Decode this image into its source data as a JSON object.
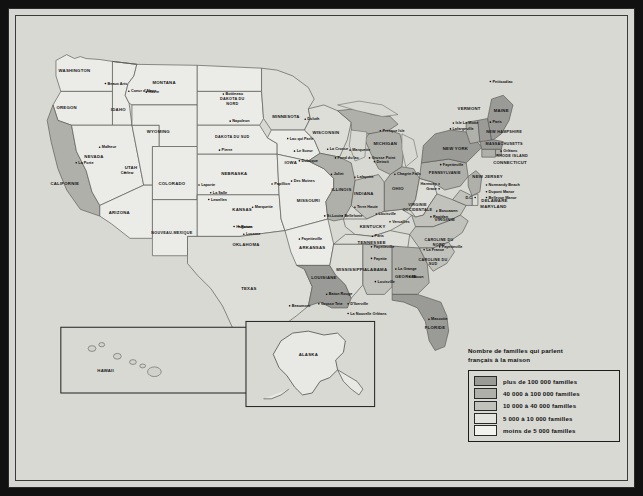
{
  "map": {
    "title": "Carte des familles francophones aux Etats-Unis",
    "legend": {
      "title": "Nombre de familles qui parlent\nfrançais à la maison",
      "entries": [
        {
          "label": "plus de 100 000 familles",
          "swatch": "c5",
          "color": "#9a9a96"
        },
        {
          "label": "40 000 à 100 000 familles",
          "swatch": "c4",
          "color": "#b0b0ab"
        },
        {
          "label": "10 000 à 40 000 familles",
          "swatch": "c3",
          "color": "#c2c2bd"
        },
        {
          "label": "5 000 à 10 000 familles",
          "swatch": "c2",
          "color": "#e4e4df"
        },
        {
          "label": "moins de 5 000 familles",
          "swatch": "c1",
          "color": "#f2f2ee"
        }
      ]
    },
    "insets": [
      {
        "name": "hawaii",
        "label": "HAWAII"
      },
      {
        "name": "alaska",
        "label": "ALASKA"
      }
    ],
    "states": [
      {
        "id": "wa",
        "label": "WASHINGTON",
        "x": 60,
        "y": 58,
        "cls": "c1"
      },
      {
        "id": "or",
        "label": "OREGON",
        "x": 52,
        "y": 96,
        "cls": "c1"
      },
      {
        "id": "ca",
        "label": "CALIFORNIE",
        "x": 50,
        "y": 175,
        "cls": "c4"
      },
      {
        "id": "id",
        "label": "IDAHO",
        "x": 105,
        "y": 98,
        "cls": "c1"
      },
      {
        "id": "nv",
        "label": "NEVADA",
        "x": 80,
        "y": 147,
        "cls": "c1"
      },
      {
        "id": "ut",
        "label": "UTAH",
        "x": 118,
        "y": 158,
        "cls": "c1"
      },
      {
        "id": "az",
        "label": "ARIZONA",
        "x": 106,
        "y": 205,
        "cls": "c1"
      },
      {
        "id": "mt",
        "label": "MONTANA",
        "x": 152,
        "y": 70,
        "cls": "c1"
      },
      {
        "id": "wy",
        "label": "WYOMING",
        "x": 146,
        "y": 121,
        "cls": "c1"
      },
      {
        "id": "co",
        "label": "COLORADO",
        "x": 160,
        "y": 175,
        "cls": "c1"
      },
      {
        "id": "nm",
        "label": "NOUVEAU-MEXIQUE",
        "x": 160,
        "y": 226,
        "cls": "c1"
      },
      {
        "id": "nd",
        "label": "DAKOTA DU NORD",
        "x": 222,
        "y": 87,
        "cls": "c1"
      },
      {
        "id": "sd",
        "label": "DAKOTA DU SUD",
        "x": 222,
        "y": 126,
        "cls": "c1"
      },
      {
        "id": "ne",
        "label": "NEBRASKA",
        "x": 224,
        "y": 165,
        "cls": "c1"
      },
      {
        "id": "ks",
        "label": "KANSAS",
        "x": 232,
        "y": 202,
        "cls": "c1"
      },
      {
        "id": "ok",
        "label": "OKLAHOMA",
        "x": 236,
        "y": 238,
        "cls": "c1"
      },
      {
        "id": "tx",
        "label": "TEXAS",
        "x": 239,
        "y": 283,
        "cls": "c2"
      },
      {
        "id": "mn",
        "label": "MINNESOTA",
        "x": 277,
        "y": 106,
        "cls": "c2"
      },
      {
        "id": "ia",
        "label": "IOWA",
        "x": 282,
        "y": 153,
        "cls": "c1"
      },
      {
        "id": "mo",
        "label": "MISSOURI",
        "x": 300,
        "y": 192,
        "cls": "c1"
      },
      {
        "id": "ar",
        "label": "ARKANSAS",
        "x": 304,
        "y": 241,
        "cls": "c1"
      },
      {
        "id": "la",
        "label": "LOUISIANE",
        "x": 316,
        "y": 272,
        "cls": "c5"
      },
      {
        "id": "wi",
        "label": "WISCONSIN",
        "x": 318,
        "y": 122,
        "cls": "c2"
      },
      {
        "id": "il",
        "label": "ILLINOIS",
        "x": 334,
        "y": 181,
        "cls": "c4"
      },
      {
        "id": "ms",
        "label": "MISSISSIPPI",
        "x": 343,
        "y": 264,
        "cls": "c2"
      },
      {
        "id": "mi",
        "label": "MICHIGAN",
        "x": 379,
        "y": 133,
        "cls": "c4"
      },
      {
        "id": "in",
        "label": "INDIANA",
        "x": 357,
        "y": 185,
        "cls": "c3"
      },
      {
        "id": "ky",
        "label": "KENTUCKY",
        "x": 366,
        "y": 219,
        "cls": "c2"
      },
      {
        "id": "tn",
        "label": "TENNESSEE",
        "x": 365,
        "y": 236,
        "cls": "c2"
      },
      {
        "id": "al",
        "label": "ALABAMA",
        "x": 369,
        "y": 264,
        "cls": "c3"
      },
      {
        "id": "oh",
        "label": "OHIO",
        "x": 392,
        "y": 180,
        "cls": "c4"
      },
      {
        "id": "ga",
        "label": "GEORGIE",
        "x": 400,
        "y": 271,
        "cls": "c4"
      },
      {
        "id": "fl",
        "label": "FLORIDE",
        "x": 430,
        "y": 324,
        "cls": "c5"
      },
      {
        "id": "wv",
        "label": "VIRGINIE OCCIDENTALE",
        "x": 412,
        "y": 197,
        "cls": "c2"
      },
      {
        "id": "va",
        "label": "VIRGINIE",
        "x": 440,
        "y": 212,
        "cls": "c3"
      },
      {
        "id": "nc",
        "label": "CAROLINE DU NORD",
        "x": 434,
        "y": 233,
        "cls": "c3"
      },
      {
        "id": "sc",
        "label": "CAROLINE DU SUD",
        "x": 428,
        "y": 253,
        "cls": "c3"
      },
      {
        "id": "pa",
        "label": "PENNSYLVANIE",
        "x": 440,
        "y": 163,
        "cls": "c4"
      },
      {
        "id": "ny",
        "label": "NEW YORK",
        "x": 451,
        "y": 139,
        "cls": "c5"
      },
      {
        "id": "vt",
        "label": "VERMONT",
        "x": 465,
        "y": 97,
        "cls": "c4"
      },
      {
        "id": "me",
        "label": "MAINE",
        "x": 498,
        "y": 99,
        "cls": "c5"
      },
      {
        "id": "nh",
        "label": "NEW HAMPSHIRE",
        "x": 501,
        "y": 121,
        "cls": "c5"
      },
      {
        "id": "ma",
        "label": "MASSACHUSETTS",
        "x": 501,
        "y": 133,
        "cls": "c5"
      },
      {
        "id": "ri",
        "label": "RHODE ISLAND",
        "x": 509,
        "y": 146,
        "cls": "c4"
      },
      {
        "id": "ct",
        "label": "CONNECTICUT",
        "x": 507,
        "y": 153,
        "cls": "c4"
      },
      {
        "id": "nj",
        "label": "NEW JERSEY",
        "x": 484,
        "y": 168,
        "cls": "c4"
      },
      {
        "id": "de",
        "label": "DELAWARE",
        "x": 491,
        "y": 192,
        "cls": "c2"
      },
      {
        "id": "md",
        "label": "MARYLAND",
        "x": 490,
        "y": 199,
        "cls": "c3"
      }
    ],
    "cities": [
      {
        "label": "Beaux Arts",
        "x": 94,
        "y": 71,
        "anchor": "start"
      },
      {
        "label": "Coeur d'Alene",
        "x": 118,
        "y": 79,
        "anchor": "start"
      },
      {
        "label": "Malheur",
        "x": 88,
        "y": 137,
        "anchor": "start"
      },
      {
        "label": "La Porte",
        "x": 64,
        "y": 153,
        "anchor": "start"
      },
      {
        "label": "Curlew",
        "x": 114,
        "y": 163,
        "anchor": "middle"
      },
      {
        "label": "Havre",
        "x": 136,
        "y": 80,
        "anchor": "start"
      },
      {
        "label": "Bottineau",
        "x": 215,
        "y": 82,
        "anchor": "start"
      },
      {
        "label": "Napoleon",
        "x": 222,
        "y": 110,
        "anchor": "start"
      },
      {
        "label": "Pierre",
        "x": 211,
        "y": 140,
        "anchor": "start"
      },
      {
        "label": "Laporte",
        "x": 190,
        "y": 176,
        "anchor": "start"
      },
      {
        "label": "La Salle",
        "x": 202,
        "y": 184,
        "anchor": "start"
      },
      {
        "label": "Lewellen",
        "x": 200,
        "y": 191,
        "anchor": "start"
      },
      {
        "label": "Papillion",
        "x": 265,
        "y": 175,
        "anchor": "start"
      },
      {
        "label": "Marquette",
        "x": 245,
        "y": 199,
        "anchor": "start"
      },
      {
        "label": "Hugoton",
        "x": 226,
        "y": 219,
        "anchor": "start"
      },
      {
        "label": "Luceme",
        "x": 236,
        "y": 227,
        "anchor": "start"
      },
      {
        "label": "Rosen",
        "x": 231,
        "y": 219,
        "anchor": "start"
      },
      {
        "label": "Duluth",
        "x": 299,
        "y": 108,
        "anchor": "start"
      },
      {
        "label": "Lac qui Parle",
        "x": 281,
        "y": 128,
        "anchor": "start"
      },
      {
        "label": "Le Sueur",
        "x": 288,
        "y": 141,
        "anchor": "start"
      },
      {
        "label": "Dubuque",
        "x": 293,
        "y": 151,
        "anchor": "start"
      },
      {
        "label": "Des Moines",
        "x": 285,
        "y": 172,
        "anchor": "start"
      },
      {
        "label": "La Crosse",
        "x": 322,
        "y": 139,
        "anchor": "start"
      },
      {
        "label": "Marquette",
        "x": 345,
        "y": 140,
        "anchor": "start"
      },
      {
        "label": "Fond du lac",
        "x": 330,
        "y": 148,
        "anchor": "start"
      },
      {
        "label": "Presque Isle",
        "x": 376,
        "y": 120,
        "anchor": "start"
      },
      {
        "label": "Grosse Point",
        "x": 365,
        "y": 148,
        "anchor": "start"
      },
      {
        "label": "Detroit",
        "x": 370,
        "y": 152,
        "anchor": "start"
      },
      {
        "label": "Joliet",
        "x": 326,
        "y": 165,
        "anchor": "start"
      },
      {
        "label": "Lafayette",
        "x": 350,
        "y": 168,
        "anchor": "start"
      },
      {
        "label": "Chagrin Falls",
        "x": 391,
        "y": 165,
        "anchor": "start"
      },
      {
        "label": "Terre Haute",
        "x": 350,
        "y": 199,
        "anchor": "start"
      },
      {
        "label": "St-Louis",
        "x": 319,
        "y": 208,
        "anchor": "start"
      },
      {
        "label": "Bellefonte",
        "x": 337,
        "y": 208,
        "anchor": "start"
      },
      {
        "label": "Louisville",
        "x": 372,
        "y": 206,
        "anchor": "start"
      },
      {
        "label": "Versailles",
        "x": 386,
        "y": 214,
        "anchor": "start"
      },
      {
        "label": "Paris",
        "x": 368,
        "y": 229,
        "anchor": "start"
      },
      {
        "label": "Fayetteville",
        "x": 293,
        "y": 232,
        "anchor": "start"
      },
      {
        "label": "Fayetteville",
        "x": 367,
        "y": 240,
        "anchor": "start"
      },
      {
        "label": "Fayette",
        "x": 367,
        "y": 252,
        "anchor": "start"
      },
      {
        "label": "La Grange",
        "x": 392,
        "y": 263,
        "anchor": "start"
      },
      {
        "label": "Macon",
        "x": 406,
        "y": 271,
        "anchor": "start"
      },
      {
        "label": "Louisville",
        "x": 371,
        "y": 276,
        "anchor": "start"
      },
      {
        "label": "Baton Rouge",
        "x": 321,
        "y": 289,
        "anchor": "start"
      },
      {
        "label": "Grosse Tete",
        "x": 313,
        "y": 299,
        "anchor": "start"
      },
      {
        "label": "Beaumont",
        "x": 283,
        "y": 301,
        "anchor": "start"
      },
      {
        "label": "D'Iberville",
        "x": 343,
        "y": 299,
        "anchor": "start"
      },
      {
        "label": "La Nouvelle Orléans",
        "x": 343,
        "y": 309,
        "anchor": "start"
      },
      {
        "label": "La Salle",
        "x": 250,
        "y": 320,
        "anchor": "start"
      },
      {
        "label": "Mascotte",
        "x": 426,
        "y": 315,
        "anchor": "start"
      },
      {
        "label": "La France",
        "x": 421,
        "y": 243,
        "anchor": "start"
      },
      {
        "label": "Fayetteville",
        "x": 437,
        "y": 240,
        "anchor": "start"
      },
      {
        "label": "Boscawen",
        "x": 434,
        "y": 203,
        "anchor": "start"
      },
      {
        "label": "Rapidan",
        "x": 428,
        "y": 209,
        "anchor": "start"
      },
      {
        "label": "Harmony",
        "x": 432,
        "y": 175,
        "anchor": "end"
      },
      {
        "label": "Grace",
        "x": 432,
        "y": 180,
        "anchor": "end"
      },
      {
        "label": "Normandy Beach",
        "x": 485,
        "y": 176,
        "anchor": "start"
      },
      {
        "label": "Dupont Manor",
        "x": 485,
        "y": 183,
        "anchor": "start"
      },
      {
        "label": "Bellevue Manor",
        "x": 485,
        "y": 189,
        "anchor": "start"
      },
      {
        "label": "Fayetteville",
        "x": 438,
        "y": 155,
        "anchor": "start"
      },
      {
        "label": "Lafargeville",
        "x": 448,
        "y": 118,
        "anchor": "start"
      },
      {
        "label": "Isle La Motte",
        "x": 451,
        "y": 112,
        "anchor": "start"
      },
      {
        "label": "Paris",
        "x": 489,
        "y": 111,
        "anchor": "start"
      },
      {
        "label": "Petitcodiac",
        "x": 489,
        "y": 69,
        "anchor": "start"
      },
      {
        "label": "Orléans",
        "x": 500,
        "y": 141,
        "anchor": "start"
      },
      {
        "label": "D.C.",
        "x": 469,
        "y": 189,
        "anchor": "end"
      }
    ]
  }
}
